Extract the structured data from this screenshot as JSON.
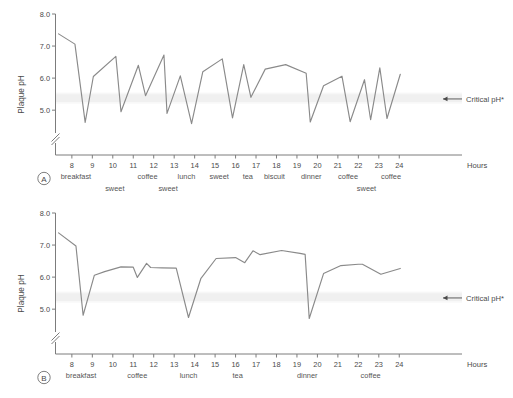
{
  "figure": {
    "title": "",
    "critical_label": "Critical pH*",
    "hours_label": "Hours",
    "y_axis_label": "Plaque pH",
    "y_ticks": [
      "8.0",
      "7.0",
      "6.0",
      "5.0"
    ],
    "x_ticks": [
      "8",
      "9",
      "10",
      "11",
      "12",
      "13",
      "14",
      "15",
      "16",
      "17",
      "18",
      "19",
      "20",
      "21",
      "22",
      "23",
      "24"
    ],
    "panel_a_letter": "A",
    "panel_b_letter": "B"
  },
  "chart_data": [
    {
      "type": "line",
      "id": "panel-a",
      "title": "A",
      "xlabel": "Hours",
      "ylabel": "Plaque pH",
      "xlim": [
        7.2,
        25.6
      ],
      "ylim": [
        4.35,
        8.05
      ],
      "ytick_values": [
        8.0,
        7.0,
        6.0,
        5.0
      ],
      "ytick_labels": [
        "8.0",
        "7.0",
        "6.0",
        "5.0"
      ],
      "xtick_values": [
        8,
        9,
        10,
        11,
        12,
        13,
        14,
        15,
        16,
        17,
        18,
        19,
        20,
        21,
        22,
        23,
        24
      ],
      "xtick_labels": [
        "8",
        "9",
        "10",
        "11",
        "12",
        "13",
        "14",
        "15",
        "16",
        "17",
        "18",
        "19",
        "20",
        "21",
        "22",
        "23",
        "24"
      ],
      "axis_break": true,
      "grid": false,
      "legend": "none",
      "critical_ph": 5.35,
      "critical_band": [
        5.25,
        5.5
      ],
      "annotations": [
        {
          "text": "Critical pH*",
          "x": 25.0,
          "y": 5.35,
          "arrow": true
        }
      ],
      "event_labels": [
        {
          "text": "breakfast",
          "hour": 8.2,
          "row": 1
        },
        {
          "text": "sweet",
          "hour": 10.1,
          "row": 2
        },
        {
          "text": "coffee",
          "hour": 11.7,
          "row": 1
        },
        {
          "text": "sweet",
          "hour": 12.7,
          "row": 2
        },
        {
          "text": "lunch",
          "hour": 13.6,
          "row": 1
        },
        {
          "text": "sweet",
          "hour": 15.2,
          "row": 1
        },
        {
          "text": "tea",
          "hour": 16.6,
          "row": 1
        },
        {
          "text": "biscuit",
          "hour": 17.9,
          "row": 1
        },
        {
          "text": "dinner",
          "hour": 19.7,
          "row": 1
        },
        {
          "text": "coffee",
          "hour": 21.5,
          "row": 1
        },
        {
          "text": "sweet",
          "hour": 22.4,
          "row": 2
        },
        {
          "text": "coffee",
          "hour": 23.6,
          "row": 1
        }
      ],
      "series": [
        {
          "name": "plaque pH (frequent sugar exposure)",
          "x": [
            7.35,
            8.15,
            8.65,
            9.05,
            10.15,
            10.4,
            11.25,
            11.6,
            12.5,
            12.65,
            13.3,
            13.85,
            14.4,
            15.35,
            15.85,
            16.4,
            16.75,
            17.45,
            18.45,
            19.45,
            19.65,
            20.3,
            21.2,
            21.6,
            22.3,
            22.6,
            23.05,
            23.4,
            24.05
          ],
          "y": [
            7.38,
            7.06,
            4.62,
            6.05,
            6.68,
            4.95,
            6.4,
            5.45,
            6.72,
            4.9,
            6.07,
            4.58,
            6.2,
            6.6,
            4.76,
            6.42,
            5.4,
            6.28,
            6.42,
            6.15,
            4.63,
            5.76,
            6.06,
            4.64,
            5.95,
            4.7,
            6.32,
            4.74,
            6.12
          ]
        }
      ]
    },
    {
      "type": "line",
      "id": "panel-b",
      "title": "B",
      "xlabel": "Hours",
      "ylabel": "Plaque pH",
      "xlim": [
        7.2,
        25.6
      ],
      "ylim": [
        4.35,
        8.05
      ],
      "ytick_values": [
        8.0,
        7.0,
        6.0,
        5.0
      ],
      "ytick_labels": [
        "8.0",
        "7.0",
        "6.0",
        "5.0"
      ],
      "xtick_values": [
        8,
        9,
        10,
        11,
        12,
        13,
        14,
        15,
        16,
        17,
        18,
        19,
        20,
        21,
        22,
        23,
        24
      ],
      "xtick_labels": [
        "8",
        "9",
        "10",
        "11",
        "12",
        "13",
        "14",
        "15",
        "16",
        "17",
        "18",
        "19",
        "20",
        "21",
        "22",
        "23",
        "24"
      ],
      "axis_break": true,
      "grid": false,
      "legend": "none",
      "critical_ph": 5.35,
      "critical_band": [
        5.25,
        5.5
      ],
      "annotations": [
        {
          "text": "Critical pH*",
          "x": 25.0,
          "y": 5.35,
          "arrow": true
        }
      ],
      "event_labels": [
        {
          "text": "breakfast",
          "hour": 8.45,
          "row": 1
        },
        {
          "text": "coffee",
          "hour": 11.2,
          "row": 1
        },
        {
          "text": "lunch",
          "hour": 13.7,
          "row": 1
        },
        {
          "text": "tea",
          "hour": 16.1,
          "row": 1
        },
        {
          "text": "dinner",
          "hour": 19.5,
          "row": 1
        },
        {
          "text": "coffee",
          "hour": 22.6,
          "row": 1
        }
      ],
      "series": [
        {
          "name": "plaque pH (restricted sugar exposure)",
          "x": [
            7.35,
            8.2,
            8.55,
            9.1,
            9.6,
            10.4,
            11.0,
            11.2,
            11.65,
            11.85,
            12.4,
            13.1,
            13.7,
            14.3,
            15.05,
            16.0,
            16.45,
            16.85,
            17.2,
            18.25,
            19.15,
            19.4,
            19.6,
            20.3,
            21.15,
            22.0,
            22.2,
            23.1,
            24.05
          ],
          "y": [
            7.38,
            6.97,
            4.81,
            6.06,
            6.17,
            6.32,
            6.31,
            5.99,
            6.43,
            6.3,
            6.29,
            6.28,
            4.74,
            5.95,
            6.58,
            6.61,
            6.45,
            6.82,
            6.7,
            6.83,
            6.74,
            6.71,
            4.71,
            6.11,
            6.36,
            6.4,
            6.4,
            6.09,
            6.27
          ]
        }
      ]
    }
  ]
}
